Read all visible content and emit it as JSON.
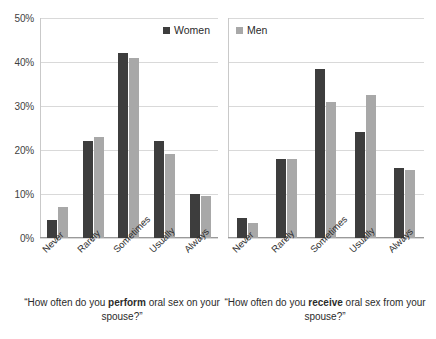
{
  "legend": {
    "position": "top-center",
    "items": [
      {
        "label": "Women",
        "color": "#3d3d3d",
        "swatch": "square-dark"
      },
      {
        "label": "Men",
        "color": "#a8a8a8",
        "swatch": "square-light"
      }
    ]
  },
  "yaxis": {
    "ticks": [
      "0%",
      "10%",
      "20%",
      "30%",
      "40%",
      "50%"
    ]
  },
  "captions": {
    "left": {
      "pre": "“How often do you ",
      "bold": "perform",
      "post": " oral sex on your spouse?”"
    },
    "right": {
      "pre": "“How often do you ",
      "bold": "receive",
      "post": " oral sex from your spouse?”"
    }
  },
  "chart_data": [
    {
      "type": "bar",
      "title": "“How often do you perform oral sex on your spouse?”",
      "xlabel": "",
      "ylabel": "",
      "ylim": [
        0,
        50
      ],
      "grid": true,
      "legend_position": "top-center",
      "categories": [
        "Never",
        "Rarely",
        "Sometimes",
        "Usually",
        "Always"
      ],
      "series": [
        {
          "name": "Women",
          "color": "#3d3d3d",
          "values": [
            4,
            22,
            42,
            22,
            10
          ]
        },
        {
          "name": "Men",
          "color": "#a8a8a8",
          "values": [
            7,
            23,
            41,
            19,
            9.5
          ]
        }
      ]
    },
    {
      "type": "bar",
      "title": "“How often do you receive oral sex from your spouse?”",
      "xlabel": "",
      "ylabel": "",
      "ylim": [
        0,
        50
      ],
      "grid": true,
      "legend_position": "top-center",
      "categories": [
        "Never",
        "Rarely",
        "Sometimes",
        "Usually",
        "Always"
      ],
      "series": [
        {
          "name": "Women",
          "color": "#3d3d3d",
          "values": [
            4.5,
            18,
            38.5,
            24,
            16
          ]
        },
        {
          "name": "Men",
          "color": "#a8a8a8",
          "values": [
            3.5,
            18,
            31,
            32.5,
            15.5
          ]
        }
      ]
    }
  ]
}
